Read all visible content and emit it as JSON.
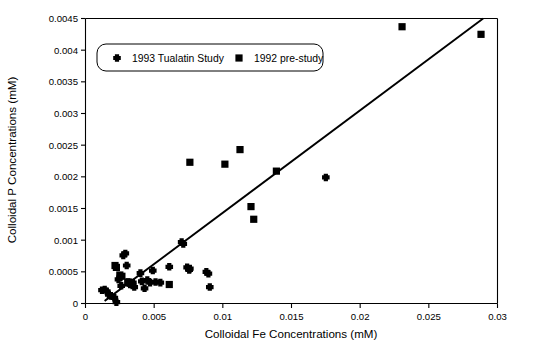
{
  "chart_data": {
    "type": "scatter",
    "title": "",
    "xlabel": "Colloidal Fe Concentrations (mM)",
    "ylabel": "Colloidal P Concentrations (mM)",
    "xlim": [
      0,
      0.03
    ],
    "ylim": [
      0,
      0.0045
    ],
    "grid": false,
    "legend_position": "top-left-inside",
    "xticks": [
      0,
      0.005,
      0.01,
      0.015,
      0.02,
      0.025,
      0.03
    ],
    "xtick_labels": [
      "0",
      "0.005",
      "0.01",
      "0.015",
      "0.02",
      "0.025",
      "0.03"
    ],
    "yticks": [
      0,
      0.0005,
      0.001,
      0.0015,
      0.002,
      0.0025,
      0.003,
      0.0035,
      0.004,
      0.0045
    ],
    "ytick_labels": [
      "0",
      "0.0005",
      "0.001",
      "0.0015",
      "0.002",
      "0.0025",
      "0.003",
      "0.0035",
      "0.004",
      "0.0045"
    ],
    "series": [
      {
        "name": "1993 Tualatin Study",
        "marker": "cross",
        "color": "#000000",
        "points": [
          [
            0.0012,
            0.00021
          ],
          [
            0.0014,
            0.00022
          ],
          [
            0.00155,
            0.00019
          ],
          [
            0.0017,
            0.00014
          ],
          [
            0.00185,
            0.00012
          ],
          [
            0.0021,
            9e-05
          ],
          [
            0.00225,
            2e-05
          ],
          [
            0.0024,
            0.00038
          ],
          [
            0.00255,
            0.00042
          ],
          [
            0.0026,
            0.00028
          ],
          [
            0.00275,
            0.00076
          ],
          [
            0.0029,
            0.00079
          ],
          [
            0.003,
            0.0006
          ],
          [
            0.0031,
            0.00034
          ],
          [
            0.00325,
            0.0003
          ],
          [
            0.0033,
            0.00032
          ],
          [
            0.00345,
            0.00033
          ],
          [
            0.00355,
            0.00026
          ],
          [
            0.004,
            0.00048
          ],
          [
            0.0041,
            0.00035
          ],
          [
            0.0043,
            0.00024
          ],
          [
            0.0045,
            0.00037
          ],
          [
            0.0047,
            0.00033
          ],
          [
            0.0049,
            0.00052
          ],
          [
            0.0051,
            0.00034
          ],
          [
            0.00545,
            0.00033
          ],
          [
            0.0061,
            0.00058
          ],
          [
            0.007,
            0.00097
          ],
          [
            0.00712,
            0.00094
          ],
          [
            0.0074,
            0.00057
          ],
          [
            0.00755,
            0.00053
          ],
          [
            0.0076,
            0.00055
          ],
          [
            0.0088,
            0.0005
          ],
          [
            0.00895,
            0.00047
          ],
          [
            0.00905,
            0.00026
          ],
          [
            0.0175,
            0.00199
          ]
        ]
      },
      {
        "name": "1992 pre-study",
        "marker": "square",
        "color": "#000000",
        "points": [
          [
            0.00215,
            0.0006
          ],
          [
            0.00225,
            0.00057
          ],
          [
            0.0025,
            0.00045
          ],
          [
            0.00265,
            0.00043
          ],
          [
            0.0031,
            0.00034
          ],
          [
            0.00325,
            0.00032
          ],
          [
            0.00335,
            0.00031
          ],
          [
            0.0061,
            0.0003
          ],
          [
            0.0076,
            0.00223
          ],
          [
            0.01015,
            0.0022
          ],
          [
            0.01125,
            0.00243
          ],
          [
            0.01205,
            0.00153
          ],
          [
            0.01225,
            0.00133
          ],
          [
            0.0139,
            0.00209
          ],
          [
            0.02305,
            0.00437
          ],
          [
            0.0288,
            0.00425
          ]
        ]
      }
    ],
    "trend_line": {
      "label": "",
      "x_start": 0.00145,
      "y_start": 5e-05,
      "x_end": 0.0289,
      "y_end": 0.00449
    }
  },
  "legend": {
    "entries": [
      {
        "label": "1993 Tualatin Study",
        "marker": "cross-marker"
      },
      {
        "label": "1992 pre-study",
        "marker": "square-marker"
      }
    ]
  }
}
